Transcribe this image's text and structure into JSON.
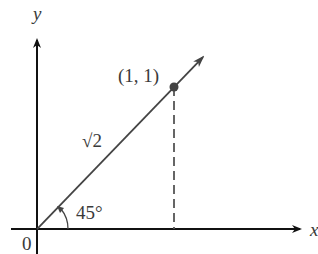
{
  "diagram": {
    "axes": {
      "x_label": "x",
      "y_label": "y",
      "origin_label": "0"
    },
    "point": {
      "label": "(1, 1)",
      "x": 1,
      "y": 1
    },
    "vector": {
      "length_label": "√2",
      "angle_label": "45°"
    },
    "colors": {
      "axis": "#111111",
      "vector": "#444444",
      "point": "#444444",
      "text": "#3a3a3a"
    }
  }
}
